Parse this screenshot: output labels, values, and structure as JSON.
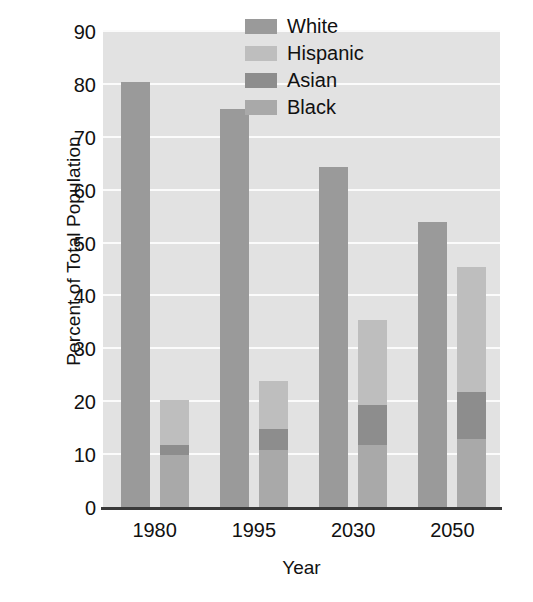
{
  "chart_data": {
    "type": "bar",
    "title": "",
    "subtitle": "",
    "xlabel": "Year",
    "ylabel": "Percent of Total Population",
    "categories": [
      "1980",
      "1995",
      "2030",
      "2050"
    ],
    "ylim": [
      0,
      90
    ],
    "yticks": [
      0,
      10,
      20,
      30,
      40,
      50,
      60,
      70,
      80,
      90
    ],
    "ytick_labels": [
      "0",
      "10",
      "20",
      "30",
      "40",
      "50",
      "60",
      "70",
      "80",
      "90"
    ],
    "grid": true,
    "grid_axis": "y",
    "legend_position": "top-right",
    "bar_layout": "grouped-with-stacked-second-bar",
    "series": [
      {
        "name": "White",
        "color": "#9a9a9a",
        "values": [
          80.5,
          75.5,
          64.5,
          54.0
        ],
        "stack": "white-bar"
      },
      {
        "name": "Hispanic",
        "color": "#bebebe",
        "values": [
          8.5,
          9.0,
          16.0,
          23.5
        ],
        "stack": "minority-bar"
      },
      {
        "name": "Asian",
        "color": "#8d8d8d",
        "values": [
          2.0,
          4.0,
          7.5,
          9.0
        ],
        "stack": "minority-bar"
      },
      {
        "name": "Black",
        "color": "#a9a9a9",
        "values": [
          10.0,
          11.0,
          12.0,
          13.0
        ],
        "stack": "minority-bar"
      }
    ],
    "stacked_totals": {
      "white-bar": [
        80.5,
        75.5,
        64.5,
        54.0
      ],
      "minority-bar": [
        20.5,
        24.0,
        35.5,
        45.5
      ]
    },
    "plot_background": "#e2e2e2",
    "gridline_color": "#fbfbfb",
    "axis_color": "#3a3a3a"
  },
  "legend": {
    "items": [
      {
        "label": "White",
        "color": "#9a9a9a"
      },
      {
        "label": "Hispanic",
        "color": "#bebebe"
      },
      {
        "label": "Asian",
        "color": "#8d8d8d"
      },
      {
        "label": "Black",
        "color": "#a9a9a9"
      }
    ]
  },
  "axes": {
    "y_title": "Percent of Total Population",
    "x_title": "Year",
    "y_ticks": [
      "90",
      "80",
      "70",
      "60",
      "50",
      "40",
      "30",
      "20",
      "10",
      "0"
    ],
    "x_ticks": [
      "1980",
      "1995",
      "2030",
      "2050"
    ]
  }
}
